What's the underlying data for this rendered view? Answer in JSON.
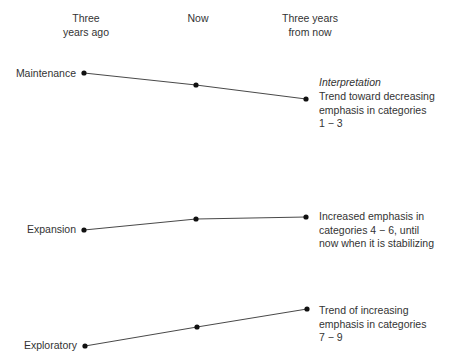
{
  "headers": [
    {
      "lines": [
        "Three",
        "years ago"
      ],
      "x": 86
    },
    {
      "lines": [
        "Now"
      ],
      "x": 198
    },
    {
      "lines": [
        "Three years",
        "from now"
      ],
      "x": 310
    }
  ],
  "interpretation_title": "Interpretation",
  "rows": [
    {
      "label": "Maintenance",
      "points": [
        [
          84,
          73
        ],
        [
          196,
          85
        ],
        [
          306,
          99
        ]
      ],
      "label_y": 67,
      "interpretation": [
        "Trend toward decreasing",
        "emphasis in categories",
        "1 − 3"
      ],
      "interp_y": 90
    },
    {
      "label": "Expansion",
      "points": [
        [
          84,
          230
        ],
        [
          196,
          219
        ],
        [
          306,
          217
        ]
      ],
      "label_y": 223,
      "interpretation": [
        "Increased emphasis in",
        "categories 4 − 6, until",
        "now when it is stabilizing"
      ],
      "interp_y": 210
    },
    {
      "label": "Exploratory",
      "points": [
        [
          85,
          346
        ],
        [
          197,
          327
        ],
        [
          307,
          309
        ]
      ],
      "label_y": 339,
      "interpretation": [
        "Trend of increasing",
        "emphasis in categories",
        "7 − 9"
      ],
      "interp_y": 304
    }
  ],
  "colors": {
    "line": "#333333",
    "dot": "#111111",
    "text": "#333333"
  }
}
